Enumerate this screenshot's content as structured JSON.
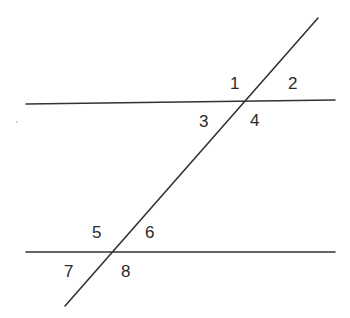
{
  "diagram": {
    "type": "parallel-lines-cut-by-transversal",
    "colors": {
      "background": "#ffffff",
      "line": "#333333",
      "text": "#2a2a2a"
    },
    "lines": {
      "top_parallel": {
        "x1": 26,
        "y1": 104,
        "x2": 335,
        "y2": 100
      },
      "bottom_parallel": {
        "x1": 26,
        "y1": 252,
        "x2": 335,
        "y2": 252
      },
      "transversal": {
        "x1": 318,
        "y1": 18,
        "x2": 65,
        "y2": 306
      }
    },
    "angle_labels": [
      {
        "text": "1",
        "x": 230,
        "y": 89
      },
      {
        "text": "2",
        "x": 288,
        "y": 89
      },
      {
        "text": "3",
        "x": 199,
        "y": 127
      },
      {
        "text": "4",
        "x": 250,
        "y": 126
      },
      {
        "text": "5",
        "x": 92,
        "y": 238
      },
      {
        "text": "6",
        "x": 145,
        "y": 238
      },
      {
        "text": "7",
        "x": 64,
        "y": 277
      },
      {
        "text": "8",
        "x": 121,
        "y": 277
      }
    ]
  }
}
